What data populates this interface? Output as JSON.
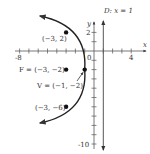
{
  "diagram": {
    "type": "parabola-graph",
    "equation_note": "(y+2)^2 = -8(x+1)",
    "axes": {
      "x_label": "x",
      "y_label": "y",
      "x_ticks_labeled": [
        "-8",
        "0",
        "4"
      ],
      "y_ticks_labeled": [
        "2",
        "-10"
      ],
      "x_range": [
        -8,
        5
      ],
      "y_range": [
        -10,
        3
      ]
    },
    "directrix": {
      "label": "D: x = 1",
      "x": 1
    },
    "points": [
      {
        "name": "point-top",
        "label": "(−3, 2)",
        "x": -3,
        "y": 2
      },
      {
        "name": "focus",
        "label": "F = (−3, −2)",
        "x": -3,
        "y": -2
      },
      {
        "name": "vertex",
        "label": "V = (−1, −2)",
        "x": -1,
        "y": -2
      },
      {
        "name": "point-bottom",
        "label": "(−3, −6)",
        "x": -3,
        "y": -6
      }
    ],
    "colors": {
      "curve": "#222222",
      "axis": "#555555",
      "directrix": "#555555",
      "text": "#333333"
    }
  }
}
